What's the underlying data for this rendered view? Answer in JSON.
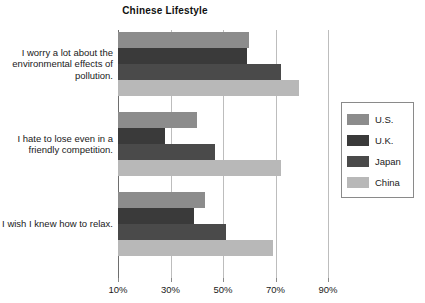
{
  "chart_data": {
    "type": "bar",
    "orientation": "horizontal",
    "title": "Chinese Lifestyle",
    "xlabel": "",
    "ylabel": "",
    "xlim": [
      10,
      90
    ],
    "xticks": [
      10,
      30,
      50,
      70,
      90
    ],
    "xtick_labels": [
      "10%",
      "30%",
      "50%",
      "70%",
      "90%"
    ],
    "grid": true,
    "legend_position": "right",
    "categories": [
      "I worry a lot about the environmental effects of pollution.",
      "I hate to lose even in a friendly competition.",
      "I wish I knew how to relax."
    ],
    "series": [
      {
        "name": "U.S.",
        "color": "#8c8c8c",
        "values": [
          60,
          40,
          43
        ]
      },
      {
        "name": "U.K.",
        "color": "#3a3a3a",
        "values": [
          59,
          28,
          39
        ]
      },
      {
        "name": "Japan",
        "color": "#4a4a4a",
        "values": [
          72,
          47,
          51
        ]
      },
      {
        "name": "China",
        "color": "#b8b8b8",
        "values": [
          79,
          72,
          69
        ]
      }
    ]
  },
  "legend": {
    "items": [
      {
        "label": "U.S.",
        "color": "#8c8c8c"
      },
      {
        "label": "U.K.",
        "color": "#3a3a3a"
      },
      {
        "label": "Japan",
        "color": "#4a4a4a"
      },
      {
        "label": "China",
        "color": "#b8b8b8"
      }
    ]
  },
  "axis": {
    "tick_labels": [
      "10%",
      "30%",
      "50%",
      "70%",
      "90%"
    ]
  },
  "category_labels": [
    "I worry a lot about the environmental effects of pollution.",
    "I hate to lose even in a friendly competition.",
    "I wish I knew how to relax."
  ]
}
